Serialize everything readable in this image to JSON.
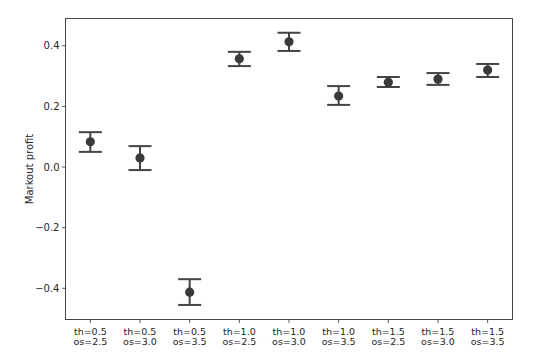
{
  "chart_data": {
    "type": "scatter",
    "subtype": "pointplot_with_errorbars",
    "title": "",
    "xlabel": "",
    "ylabel": "Markout profit",
    "categories": [
      [
        "th=0.5",
        "os=2.5"
      ],
      [
        "th=0.5",
        "os=3.0"
      ],
      [
        "th=0.5",
        "os=3.5"
      ],
      [
        "th=1.0",
        "os=2.5"
      ],
      [
        "th=1.0",
        "os=3.0"
      ],
      [
        "th=1.0",
        "os=3.5"
      ],
      [
        "th=1.5",
        "os=2.5"
      ],
      [
        "th=1.5",
        "os=3.0"
      ],
      [
        "th=1.5",
        "os=3.5"
      ]
    ],
    "values": [
      0.083,
      0.03,
      -0.413,
      0.357,
      0.413,
      0.234,
      0.28,
      0.29,
      0.32
    ],
    "error_low": [
      0.05,
      -0.01,
      -0.455,
      0.333,
      0.383,
      0.205,
      0.264,
      0.271,
      0.297
    ],
    "error_high": [
      0.115,
      0.069,
      -0.37,
      0.38,
      0.443,
      0.267,
      0.297,
      0.31,
      0.34
    ],
    "yticks": [
      0.4,
      0.2,
      0.0,
      -0.2,
      -0.4
    ],
    "ytick_labels": [
      "0.4",
      "0.2",
      "0.0",
      "−0.2",
      "−0.4"
    ],
    "ylim": [
      -0.503,
      0.49
    ],
    "grid": false,
    "legend": null,
    "colors": {
      "point": "#3a3a3a",
      "errorbar": "#444444",
      "axis": "#333333",
      "text": "#262626"
    }
  }
}
